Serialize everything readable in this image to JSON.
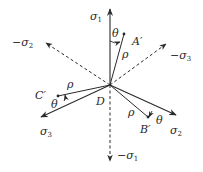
{
  "diagram": {
    "center_label": "D",
    "axes": [
      {
        "id": "sigma1",
        "label": "σ",
        "sub": "1",
        "prefix": "",
        "style": "solid"
      },
      {
        "id": "neg-sigma1",
        "label": "σ",
        "sub": "1",
        "prefix": "−",
        "style": "dashed"
      },
      {
        "id": "sigma2",
        "label": "σ",
        "sub": "2",
        "prefix": "",
        "style": "solid"
      },
      {
        "id": "neg-sigma2",
        "label": "σ",
        "sub": "2",
        "prefix": "−",
        "style": "dashed"
      },
      {
        "id": "sigma3",
        "label": "σ",
        "sub": "3",
        "prefix": "",
        "style": "solid"
      },
      {
        "id": "neg-sigma3",
        "label": "σ",
        "sub": "3",
        "prefix": "−",
        "style": "dashed"
      }
    ],
    "points": [
      {
        "id": "A",
        "label": "A′",
        "rho": "ρ",
        "theta": "θ"
      },
      {
        "id": "B",
        "label": "B′",
        "rho": "ρ",
        "theta": "θ"
      },
      {
        "id": "C",
        "label": "C′",
        "rho": "ρ",
        "theta": "θ"
      }
    ],
    "colors": {
      "line": "#2a2a2a",
      "background": "#ffffff"
    }
  }
}
